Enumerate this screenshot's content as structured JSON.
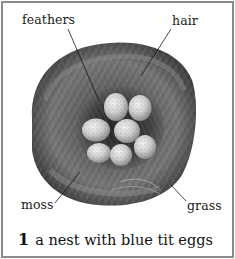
{
  "figure": {
    "number": "1",
    "caption": "a nest with blue tit eggs",
    "labels": {
      "feathers": "feathers",
      "hair": "hair",
      "moss": "moss",
      "grass": "grass"
    },
    "egg_count": 7,
    "image_description": "black-and-white photograph of a round bird nest made of moss, grass, hair and feathers containing seven speckled eggs"
  },
  "colors": {
    "border": "#8c8c8c",
    "background": "#ffffff",
    "text": "#1a1a1a"
  }
}
